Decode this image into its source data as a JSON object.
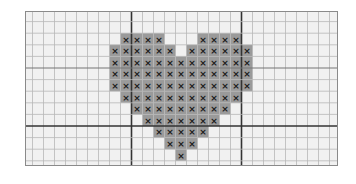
{
  "pattern": {
    "title": "Heart cross-stitch chart",
    "stitch_symbol": "×",
    "colors": {
      "background": "#f1f1f1",
      "stitch_fill": "#9a9a9a",
      "symbol": "#1a1a1a",
      "minor_line": "#b8b8b8",
      "major_line": "#333333"
    },
    "rows": [
      [
        1,
        2,
        3,
        4,
        8,
        9,
        10,
        11
      ],
      [
        0,
        1,
        2,
        3,
        4,
        5,
        7,
        8,
        9,
        10,
        11,
        12
      ],
      [
        0,
        1,
        2,
        3,
        4,
        5,
        6,
        7,
        8,
        9,
        10,
        11,
        12
      ],
      [
        0,
        1,
        2,
        3,
        4,
        5,
        6,
        7,
        8,
        9,
        10,
        11,
        12
      ],
      [
        0,
        1,
        2,
        3,
        4,
        5,
        6,
        7,
        8,
        9,
        10,
        11,
        12
      ],
      [
        1,
        2,
        3,
        4,
        5,
        6,
        7,
        8,
        9,
        10,
        11
      ],
      [
        2,
        3,
        4,
        5,
        6,
        7,
        8,
        9,
        10
      ],
      [
        3,
        4,
        5,
        6,
        7,
        8,
        9
      ],
      [
        4,
        5,
        6,
        7,
        8
      ],
      [
        5,
        6,
        7
      ],
      [
        6
      ]
    ]
  }
}
